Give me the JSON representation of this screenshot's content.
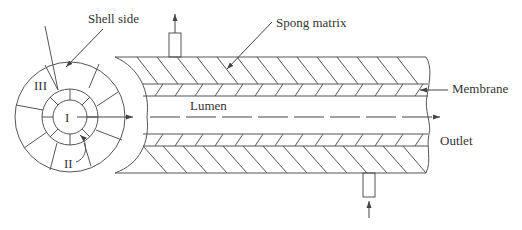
{
  "diagram": {
    "type": "hollow-fiber membrane module cross-section and longitudinal view",
    "labels": {
      "shell_side": "Shell side",
      "spong_matrix": "Spong matrix",
      "membrane": "Membrane",
      "lumen": "Lumen",
      "outlet": "Outlet",
      "region_1": "I",
      "region_2": "II",
      "region_3": "III"
    },
    "colors": {
      "line": "#555555",
      "text": "#333333",
      "background": "#ffffff"
    }
  }
}
